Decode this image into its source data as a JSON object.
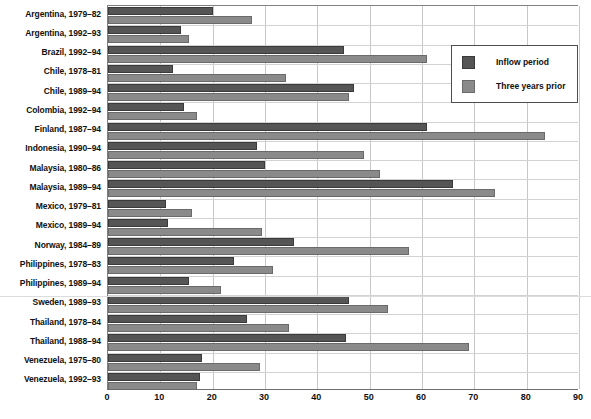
{
  "chart_data": {
    "type": "bar",
    "orientation": "horizontal",
    "title": "",
    "xlabel": "",
    "ylabel": "",
    "xlim": [
      0,
      90
    ],
    "xticks": [
      0,
      10,
      20,
      30,
      40,
      50,
      60,
      70,
      80,
      90
    ],
    "grid": true,
    "legend_position": "top-right",
    "categories": [
      "Argentina, 1979–82",
      "Argentina, 1992–93",
      "Brazil, 1992–94",
      "Chile, 1978–81",
      "Chile, 1989–94",
      "Colombia, 1992–94",
      "Finland, 1987–94",
      "Indonesia, 1990–94",
      "Malaysia, 1980–86",
      "Malaysia, 1989–94",
      "Mexico, 1979–81",
      "Mexico, 1989–94",
      "Norway, 1984–89",
      "Philippines, 1978–83",
      "Philippines, 1989–94",
      "Sweden, 1989–93",
      "Thailand, 1978–84",
      "Thailand, 1988–94",
      "Venezuela, 1975–80",
      "Venezuela, 1992–93"
    ],
    "series": [
      {
        "name": "Inflow period",
        "color": "#555555",
        "values": [
          20,
          14,
          45,
          12.5,
          47,
          14.5,
          61,
          28.5,
          30,
          66,
          11,
          11.5,
          35.5,
          24,
          15.5,
          46,
          26.5,
          45.5,
          18,
          17.5
        ]
      },
      {
        "name": "Three years prior",
        "color": "#8a8a8a",
        "values": [
          27.5,
          15.5,
          61,
          34,
          46,
          17,
          83.5,
          49,
          52,
          74,
          16,
          29.5,
          57.5,
          31.5,
          21.5,
          53.5,
          34.5,
          69,
          29,
          17
        ]
      }
    ]
  },
  "legend": {
    "items": [
      {
        "label": "Inflow period"
      },
      {
        "label": "Three years prior"
      }
    ]
  }
}
